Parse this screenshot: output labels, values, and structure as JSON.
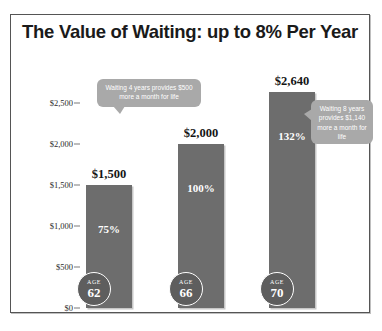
{
  "chart_data": {
    "type": "bar",
    "title": "The Value of Waiting: up to 8% Per Year",
    "xlabel": "",
    "ylabel": "",
    "ylim": [
      0,
      2700
    ],
    "grid": false,
    "legend": "none",
    "categories": [
      "AGE 62",
      "AGE 66",
      "AGE 70"
    ],
    "values": [
      1500,
      2000,
      2640
    ],
    "value_labels": [
      "$1,500",
      "$2,000",
      "$2,640"
    ],
    "percent_labels": [
      "75%",
      "100%",
      "132%"
    ],
    "percent_values": [
      75,
      100,
      132
    ],
    "age_labels": [
      "AGE",
      "AGE",
      "AGE"
    ],
    "age_numbers": [
      "62",
      "66",
      "70"
    ],
    "ytick_labels": [
      "$2,500",
      "$2,000",
      "$1,500",
      "$1,000",
      "$500",
      "$0"
    ],
    "ytick_values": [
      2500,
      2000,
      1500,
      1000,
      500,
      0
    ],
    "annotations": [
      "Waiting 4 years provides $500 more a month for life",
      "Waiting 8 years provides $1,140 more a month for life"
    ],
    "bar_color": "#6d6d6d",
    "callout_color": "#a9a9a9",
    "badge_color": "#5e5e5e"
  },
  "callouts": {
    "first": "Waiting 4 years provides $500 more a month for life",
    "second": "Waiting 8 years provides $1,140 more a month for life"
  }
}
